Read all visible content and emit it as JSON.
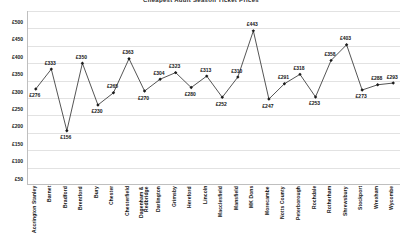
{
  "chart_data": {
    "type": "line",
    "title": "Cheapest Adult Season Ticket Prices",
    "xlabel": "",
    "ylabel": "",
    "ylim": [
      0,
      500
    ],
    "ytick_step": 50,
    "yticks": [
      "£500",
      "£450",
      "£400",
      "£350",
      "£300",
      "£250",
      "£200",
      "£150",
      "£100",
      "£50"
    ],
    "ytick_values": [
      500,
      450,
      400,
      350,
      300,
      250,
      200,
      150,
      100,
      50
    ],
    "grid": true,
    "legend": "none",
    "marker": "diamond",
    "data_labels": true,
    "currency_symbol": "£",
    "categories": [
      "Accrington Stanley",
      "Barnet",
      "Bradford",
      "Brentford",
      "Bury",
      "Chester",
      "Chesterfield",
      "Dagenham & Redbridge",
      "Darlington",
      "Grimsby",
      "Hereford",
      "Lincoln",
      "Macclesfield",
      "Mansfield",
      "MK Dons",
      "Morecambe",
      "Notts County",
      "Peterborough",
      "Rochdale",
      "Rotherham",
      "Shrewsbury",
      "Stockport",
      "Wrexham",
      "Wycombe"
    ],
    "values": [
      276,
      333,
      156,
      350,
      230,
      265,
      363,
      270,
      304,
      323,
      280,
      313,
      252,
      310,
      443,
      247,
      291,
      318,
      253,
      358,
      403,
      273,
      288,
      293
    ],
    "point_labels": [
      "£276",
      "£333",
      "£156",
      "£350",
      "£230",
      "£265",
      "£363",
      "£270",
      "£304",
      "£323",
      "£280",
      "£313",
      "£252",
      "£310",
      "£443",
      "£247",
      "£291",
      "£318",
      "£253",
      "£358",
      "£403",
      "£273",
      "£288",
      "£293"
    ],
    "label_positions": [
      "below",
      "above",
      "below",
      "above",
      "below",
      "above",
      "above",
      "below",
      "above",
      "above",
      "below",
      "above",
      "below",
      "above",
      "above",
      "below",
      "above",
      "above",
      "below",
      "above",
      "above",
      "below",
      "above",
      "above"
    ],
    "colors": {
      "line": "#1c1c1c",
      "marker": "#1c1c1c",
      "grid": "#e2e2e2",
      "axis": "#bfbfbf",
      "text": "#161616",
      "background": "#ffffff"
    }
  }
}
